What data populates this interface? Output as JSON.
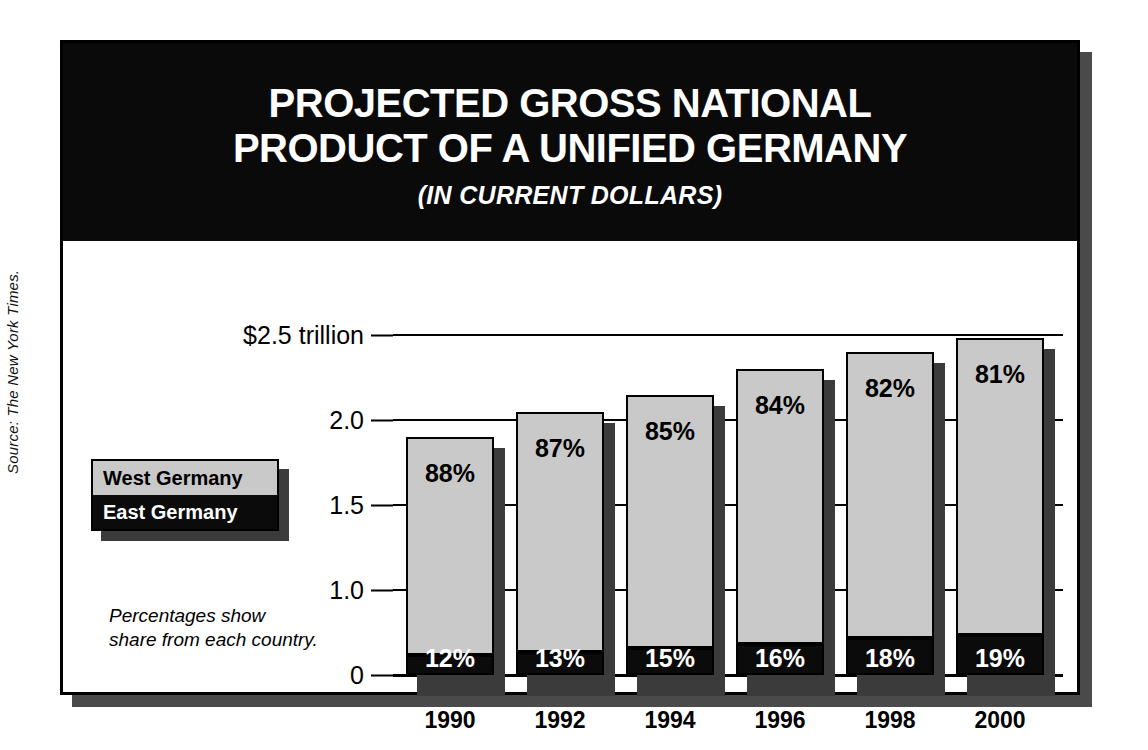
{
  "source_note": "Source: The New York Times.",
  "header": {
    "title_line1": "PROJECTED GROSS NATIONAL",
    "title_line2": "PRODUCT OF A UNIFIED GERMANY",
    "subtitle": "(IN CURRENT DOLLARS)"
  },
  "legend": {
    "west_label": "West Germany",
    "east_label": "East Germany"
  },
  "footnote": {
    "line1": "Percentages show",
    "line2": "share from each country."
  },
  "colors": {
    "west_fill": "#c9c9c9",
    "east_fill": "#0b0b0b",
    "banner_bg": "#0a0a0a",
    "shadow": "#3b3b3b",
    "frame": "#000000",
    "page_bg": "#ffffff"
  },
  "chart_data": {
    "type": "bar",
    "subtype": "stacked",
    "title": "PROJECTED GROSS NATIONAL PRODUCT OF A UNIFIED GERMANY",
    "subtitle": "(IN CURRENT DOLLARS)",
    "xlabel": "",
    "ylabel": "",
    "unit": "trillion US dollars (current)",
    "grid": true,
    "legend_position": "left-middle",
    "axis_note": "Y axis is compressed between 0 and 1.0 (broken scale); above 1.0 ticks are evenly spaced every 0.5",
    "categories": [
      "1990",
      "1992",
      "1994",
      "1996",
      "1998",
      "2000"
    ],
    "ytick_labels": [
      "$2.5 trillion",
      "2.0",
      "1.5",
      "1.0",
      "0"
    ],
    "ytick_values": [
      2.5,
      2.0,
      1.5,
      1.0,
      0
    ],
    "ylim": [
      0,
      2.5
    ],
    "series": [
      {
        "name": "East Germany",
        "color": "#0b0b0b",
        "values": [
          0.23,
          0.27,
          0.32,
          0.37,
          0.43,
          0.47
        ],
        "data_labels": [
          "12%",
          "13%",
          "15%",
          "16%",
          "18%",
          "19%"
        ],
        "shares_pct": [
          12,
          13,
          15,
          16,
          18,
          19
        ]
      },
      {
        "name": "West Germany",
        "color": "#c9c9c9",
        "values": [
          1.67,
          1.78,
          1.83,
          1.93,
          1.97,
          2.01
        ],
        "data_labels": [
          "88%",
          "87%",
          "85%",
          "84%",
          "82%",
          "81%"
        ],
        "shares_pct": [
          88,
          87,
          85,
          84,
          82,
          81
        ]
      }
    ],
    "totals": [
      1.9,
      2.05,
      2.15,
      2.3,
      2.4,
      2.48
    ]
  }
}
